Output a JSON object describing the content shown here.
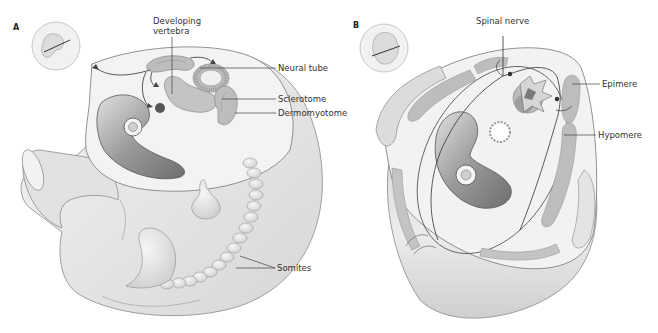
{
  "figure": {
    "panels": [
      {
        "id": "A",
        "label": "A",
        "annotations": {
          "developing_vertebra_line1": "Developing",
          "developing_vertebra_line2": "vertebra",
          "neural_tube": "Neural tube",
          "sclerotome": "Sclerotome",
          "dermomyotome": "Dermomyotome",
          "somites": "Somites"
        }
      },
      {
        "id": "B",
        "label": "B",
        "annotations": {
          "spinal_nerve": "Spinal nerve",
          "epimere": "Epimere",
          "hypomere": "Hypomere"
        }
      }
    ],
    "colors": {
      "body": "#ececec",
      "body_shade": "#d2d2d2",
      "tissue": "#b9b9b9",
      "tissue_dark": "#8d8d8d",
      "cavity": "#a8a8a8",
      "line": "#444444"
    }
  }
}
